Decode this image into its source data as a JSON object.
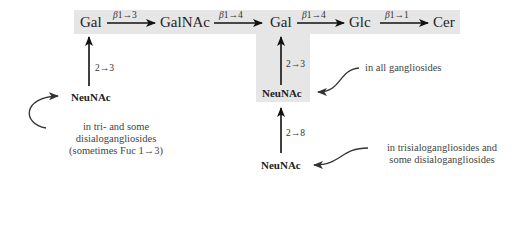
{
  "backbone": {
    "nodes": [
      "Gal",
      "GalNAc",
      "Gal",
      "Glc",
      "Cer"
    ],
    "links": [
      {
        "anomer": "β",
        "bond": "1→3"
      },
      {
        "anomer": "β",
        "bond": "1→4"
      },
      {
        "anomer": "β",
        "bond": "1→4"
      },
      {
        "anomer": "β",
        "bond": "1→1"
      }
    ]
  },
  "branches": {
    "left": {
      "residue": "NeuNAc",
      "bond": "2→3",
      "note_lines": [
        "in tri- and some",
        "disialogangliosides",
        "(sometimes Fuc 1→3)"
      ]
    },
    "center": {
      "residue": "NeuNAc",
      "bond": "2→3",
      "note": "in all gangliosides"
    },
    "lower": {
      "residue": "NeuNAc",
      "bond": "2→8",
      "note_lines": [
        "in trisialogangliosides and",
        "some disialogangliosides"
      ]
    }
  },
  "colors": {
    "highlight": "#e6e6e6",
    "arrow": "#111111",
    "curve": "#333333"
  }
}
